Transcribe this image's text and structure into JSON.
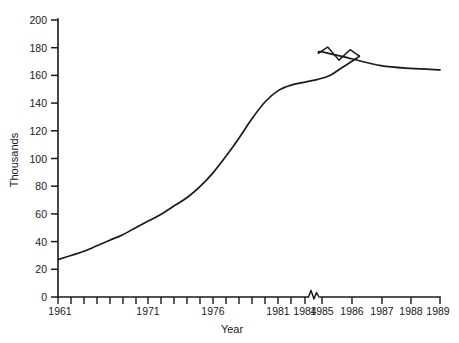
{
  "chart_data": {
    "type": "line",
    "title": "",
    "xlabel": "Year",
    "ylabel": "Thousands",
    "xlim": [
      1961,
      1989
    ],
    "ylim": [
      0,
      200
    ],
    "grid": false,
    "legend": "none",
    "axis_break": {
      "axis": "x",
      "between": [
        "1984",
        "1985"
      ],
      "style": "zigzag",
      "note": "break on x-axis and on the data line"
    },
    "y_ticks": [
      0,
      20,
      40,
      60,
      80,
      100,
      120,
      140,
      160,
      180,
      200
    ],
    "y_tick_labels": [
      "0",
      "20",
      "40",
      "60",
      "80",
      "100",
      "120",
      "140",
      "160",
      "180",
      "200"
    ],
    "x_tick_labels": [
      "1961",
      "1971",
      "1976",
      "1981",
      "1984",
      "1985",
      "1986",
      "1987",
      "1988",
      "1989"
    ],
    "x_minor_tick_count": 24,
    "series": [
      {
        "name": "Thousands",
        "color": "#1b1b1b",
        "x": [
          1961,
          1962,
          1963,
          1964,
          1965,
          1966,
          1967,
          1968,
          1969,
          1970,
          1971,
          1972,
          1973,
          1974,
          1975,
          1976,
          1977,
          1978,
          1979,
          1980,
          1981,
          1982,
          1983,
          1984,
          1985,
          1986,
          1987,
          1988,
          1989
        ],
        "values": [
          27,
          30,
          33,
          37,
          41,
          45,
          50,
          55,
          60,
          66,
          72,
          80,
          90,
          102,
          115,
          129,
          141,
          149,
          153,
          155,
          157,
          160,
          166,
          172,
          177,
          172,
          167,
          165,
          164
        ]
      }
    ]
  },
  "axis": {
    "y_label": "Thousands",
    "x_label": "Year"
  },
  "background_color": "#ffffff",
  "line_color": "#1b1b1b",
  "axis_color": "#1a1a1a"
}
